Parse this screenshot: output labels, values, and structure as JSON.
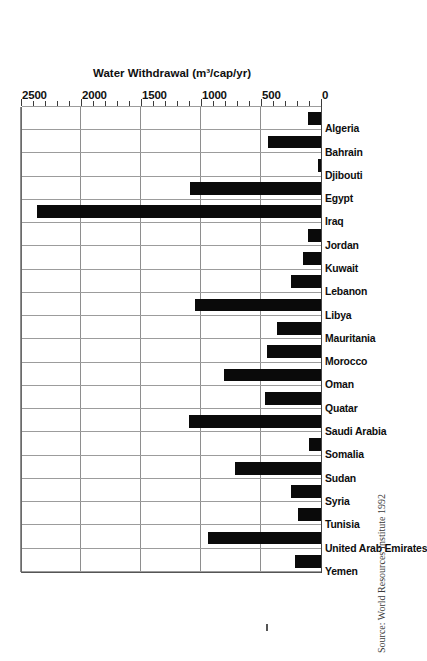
{
  "chart_data": {
    "type": "bar",
    "title": "",
    "xlabel": "",
    "ylabel": "Water Withdrawal (m³/cap/yr)",
    "ylim": [
      0,
      2500
    ],
    "ytick_labels": [
      "0",
      "500",
      "1000",
      "1500",
      "2000",
      "2500"
    ],
    "ytick_values": [
      0,
      500,
      1000,
      1500,
      2000,
      2500
    ],
    "minor_tick_step": 100,
    "grid": true,
    "legend": "none",
    "orientation": "vertical-bars-rotated-90",
    "bar_color": "#0a0a0a",
    "categories": [
      "Yemen",
      "United Arab Emirates",
      "Tunisia",
      "Syria",
      "Sudan",
      "Somalia",
      "Saudi Arabia",
      "Quatar",
      "Oman",
      "Morocco",
      "Mauritania",
      "Libya",
      "Lebanon",
      "Kuwait",
      "Jordan",
      "Iraq",
      "Egypt",
      "Djibouti",
      "Bahrain",
      "Algeria"
    ],
    "values": [
      220,
      940,
      190,
      250,
      720,
      100,
      1100,
      470,
      810,
      450,
      370,
      1050,
      250,
      150,
      110,
      2370,
      1090,
      25,
      440,
      110
    ]
  },
  "source": {
    "credit": "Source: World Resources Institute 1992"
  },
  "axis": {
    "value_axis_title": "Water Withdrawal (m³/cap/yr)"
  },
  "colors": {
    "bar": "#0a0a0a",
    "grid": "#8e8e8e",
    "axis": "#444444",
    "text": "#101010",
    "source_text": "#3a3a3a"
  }
}
